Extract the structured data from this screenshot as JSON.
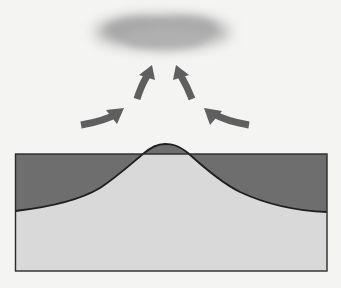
{
  "figure": {
    "colors": {
      "page_background": "#f4f4f2",
      "sea": "#6e6e6e",
      "land": "#d9d9d9",
      "outline": "#1e1e1e",
      "arrow": "#5f5f5f",
      "cloud": "#a9a9a9"
    },
    "elements": {
      "cloud": "cloud",
      "arrows": [
        "arrow-left-inflow",
        "arrow-left-rising",
        "arrow-right-rising",
        "arrow-right-inflow"
      ],
      "terrain": "mountain-profile",
      "frame": "cross-section-frame"
    }
  }
}
